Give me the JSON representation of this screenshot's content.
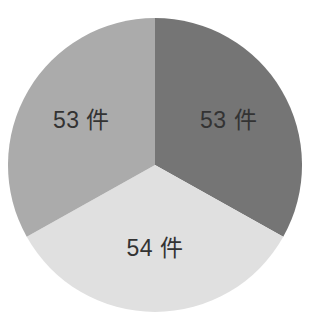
{
  "chart_data": {
    "type": "pie",
    "title": "",
    "unit": "件",
    "slices": [
      {
        "label": "53 件",
        "value": 53,
        "color": "#757575"
      },
      {
        "label": "54 件",
        "value": 54,
        "color": "#e0e0e0"
      },
      {
        "label": "53 件",
        "value": 53,
        "color": "#ababab"
      }
    ],
    "total": 160,
    "start_angle_deg": 0,
    "direction": "clockwise",
    "legend": "none",
    "center": [
      155,
      165
    ],
    "radius": 147,
    "label_radius_ratio": 0.58,
    "label_color": "#333333",
    "background": "#ffffff"
  }
}
